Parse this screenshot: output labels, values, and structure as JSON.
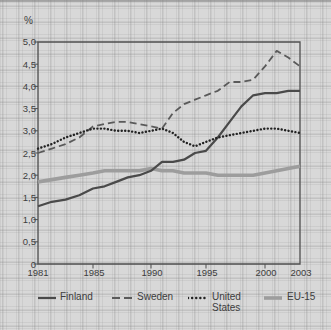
{
  "figure": {
    "unit": "%",
    "y_ticks": [
      "5,0",
      "4,5",
      "4,0",
      "3,5",
      "3,0",
      "2,5",
      "2,0",
      "1,5",
      "1,0",
      "0,5",
      "0"
    ],
    "x_ticks": [
      "1981",
      "1985",
      "1990",
      "1995",
      "2000",
      "2003"
    ]
  },
  "legend": {
    "items": [
      {
        "label": "Finland"
      },
      {
        "label": "Sweden"
      },
      {
        "label": "United States"
      },
      {
        "label": "EU-15"
      }
    ]
  },
  "chart_data": {
    "type": "line",
    "title": "",
    "xlabel": "",
    "ylabel": "%",
    "xlim": [
      1981,
      2003
    ],
    "ylim": [
      0,
      5
    ],
    "y_tick_step": 0.5,
    "x_tick_years": [
      1981,
      1985,
      1990,
      1995,
      2000,
      2003
    ],
    "grid": "graph-paper background",
    "legend_position": "bottom",
    "x": [
      1981,
      1982,
      1983,
      1984,
      1985,
      1986,
      1987,
      1988,
      1989,
      1990,
      1991,
      1992,
      1993,
      1994,
      1995,
      1996,
      1997,
      1998,
      1999,
      2000,
      2001,
      2002,
      2003
    ],
    "series": [
      {
        "id": "eu15",
        "name": "EU-15",
        "dash": "solid",
        "color": "#9d9d9d",
        "width": 3.6,
        "values": [
          1.85,
          1.9,
          1.95,
          2.0,
          2.05,
          2.1,
          2.1,
          2.1,
          2.1,
          2.15,
          2.1,
          2.1,
          2.05,
          2.05,
          2.05,
          2.0,
          2.0,
          2.0,
          2.0,
          2.05,
          2.1,
          2.15,
          2.2
        ]
      },
      {
        "id": "sweden",
        "name": "Sweden",
        "dash": "dashed",
        "color": "#5a5a5a",
        "width": 1.8,
        "values": [
          2.5,
          2.6,
          2.7,
          2.85,
          3.1,
          3.15,
          3.2,
          3.2,
          3.15,
          3.1,
          3.05,
          3.4,
          3.6,
          3.7,
          3.8,
          3.9,
          4.1,
          4.1,
          4.15,
          4.45,
          4.8,
          4.65,
          4.45
        ]
      },
      {
        "id": "finland",
        "name": "Finland",
        "dash": "solid",
        "color": "#4a4a4a",
        "width": 2.2,
        "values": [
          1.3,
          1.4,
          1.45,
          1.55,
          1.7,
          1.75,
          1.85,
          1.95,
          2.0,
          2.1,
          2.3,
          2.3,
          2.35,
          2.5,
          2.55,
          2.85,
          3.2,
          3.55,
          3.8,
          3.85,
          3.85,
          3.9,
          3.9
        ]
      },
      {
        "id": "united-states",
        "name": "United States",
        "dash": "dotted",
        "color": "#222222",
        "width": 2.4,
        "values": [
          2.6,
          2.7,
          2.85,
          2.95,
          3.05,
          3.05,
          3.0,
          3.0,
          2.95,
          3.0,
          3.05,
          2.95,
          2.75,
          2.65,
          2.75,
          2.85,
          2.9,
          2.95,
          3.0,
          3.05,
          3.05,
          3.0,
          2.95
        ]
      }
    ]
  }
}
